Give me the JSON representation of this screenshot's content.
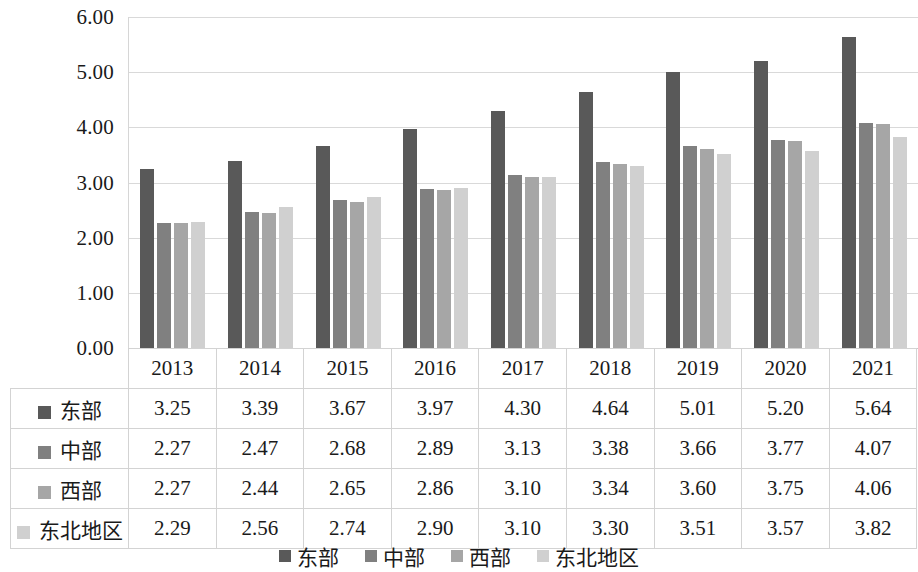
{
  "chart_data": {
    "type": "bar",
    "title": "",
    "subtitle": "",
    "xlabel": "",
    "ylabel": "",
    "categories": [
      "2013",
      "2014",
      "2015",
      "2016",
      "2017",
      "2018",
      "2019",
      "2020",
      "2021"
    ],
    "series": [
      {
        "name": "东部",
        "color": "#595959",
        "values": [
          3.25,
          3.39,
          3.67,
          3.97,
          4.3,
          4.64,
          5.01,
          5.2,
          5.64
        ]
      },
      {
        "name": "中部",
        "color": "#808080",
        "values": [
          2.27,
          2.47,
          2.68,
          2.89,
          3.13,
          3.38,
          3.66,
          3.77,
          4.07
        ]
      },
      {
        "name": "西部",
        "color": "#a6a6a6",
        "values": [
          2.27,
          2.44,
          2.65,
          2.86,
          3.1,
          3.34,
          3.6,
          3.75,
          4.06
        ]
      },
      {
        "name": "东北地区",
        "color": "#d0d0d0",
        "values": [
          2.29,
          2.56,
          2.74,
          2.9,
          3.1,
          3.3,
          3.51,
          3.57,
          3.82
        ]
      }
    ],
    "ylim": [
      0,
      6
    ],
    "ytick_values": [
      0,
      1,
      2,
      3,
      4,
      5,
      6
    ],
    "ytick_labels": [
      "0.00",
      "1.00",
      "2.00",
      "3.00",
      "4.00",
      "5.00",
      "6.00"
    ],
    "grid": true,
    "legend_position": "bottom",
    "value_format": "0.00"
  },
  "table": {
    "corner_label": "",
    "column_headers": [
      "2013",
      "2014",
      "2015",
      "2016",
      "2017",
      "2018",
      "2019",
      "2020",
      "2021"
    ],
    "rows": [
      {
        "label": "东部",
        "color": "#595959",
        "values": [
          "3.25",
          "3.39",
          "3.67",
          "3.97",
          "4.30",
          "4.64",
          "5.01",
          "5.20",
          "5.64"
        ]
      },
      {
        "label": "中部",
        "color": "#808080",
        "values": [
          "2.27",
          "2.47",
          "2.68",
          "2.89",
          "3.13",
          "3.38",
          "3.66",
          "3.77",
          "4.07"
        ]
      },
      {
        "label": "西部",
        "color": "#a6a6a6",
        "values": [
          "2.27",
          "2.44",
          "2.65",
          "2.86",
          "3.10",
          "3.34",
          "3.60",
          "3.75",
          "4.06"
        ]
      },
      {
        "label": "东北地区",
        "color": "#d0d0d0",
        "values": [
          "2.29",
          "2.56",
          "2.74",
          "2.90",
          "3.10",
          "3.30",
          "3.51",
          "3.57",
          "3.82"
        ]
      }
    ]
  },
  "legend": {
    "items": [
      {
        "label": "东部",
        "color": "#595959"
      },
      {
        "label": "中部",
        "color": "#808080"
      },
      {
        "label": "西部",
        "color": "#a6a6a6"
      },
      {
        "label": "东北地区",
        "color": "#d0d0d0"
      }
    ]
  },
  "colors": {
    "gridline": "#d9d9d9",
    "axis_text": "#1a1a1a",
    "table_border": "#d3d3d3",
    "background": "#ffffff"
  }
}
